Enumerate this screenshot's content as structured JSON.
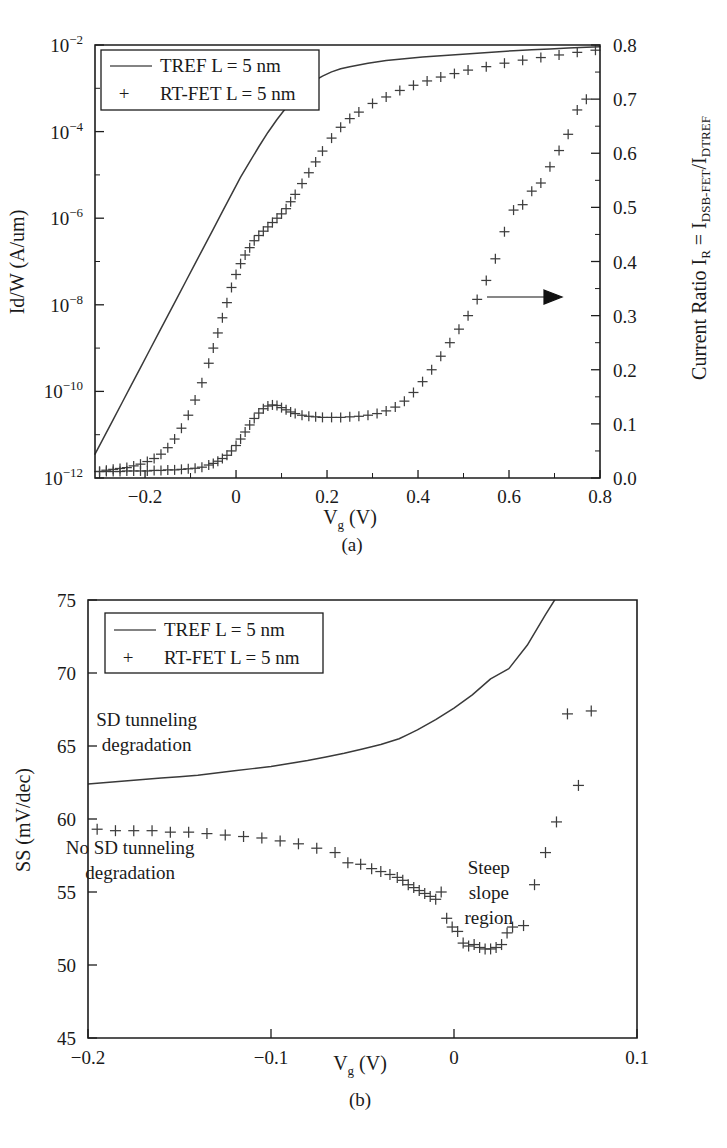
{
  "figure": {
    "panel_a_label": "(a)",
    "panel_b_label": "(b)"
  },
  "legend": {
    "series_line_label": "TREF L = 5 nm",
    "series_marker_label": "RT-FET L = 5 nm",
    "marker_glyph": "+"
  },
  "panel_a": {
    "xlabel_main": "V",
    "xlabel_sub": "g",
    "xlabel_unit": " (V)",
    "ylabel_left": "Id/W (A/um)",
    "ylabel_right_prefix": "Current Ratio I",
    "ylabel_right_sub1": "R",
    "ylabel_right_mid": " = I",
    "ylabel_right_sub2": "DSB-FET",
    "ylabel_right_slash": "/I",
    "ylabel_right_sub3": "DTREF",
    "xticks": [
      "-0.2",
      "0",
      "0.2",
      "0.4",
      "0.6",
      "0.8"
    ],
    "xtick_values": [
      -0.2,
      0,
      0.2,
      0.4,
      0.6,
      0.8
    ],
    "ytick_left_mantissa": "10",
    "ytick_left_exponents": [
      "-2",
      "-4",
      "-6",
      "-8",
      "-10",
      "-12"
    ],
    "ytick_right": [
      "0.0",
      "0.1",
      "0.2",
      "0.3",
      "0.4",
      "0.5",
      "0.6",
      "0.7",
      "0.8"
    ],
    "arrow_annotation": "arrow-pointing-right-to-right-axis"
  },
  "panel_b": {
    "xlabel_main": "V",
    "xlabel_sub": "g",
    "xlabel_unit": " (V)",
    "ylabel": "SS (mV/dec)",
    "xticks": [
      "-0.2",
      "-0.1",
      "0",
      "0.1"
    ],
    "xtick_values": [
      -0.2,
      -0.1,
      0,
      0.1
    ],
    "yticks": [
      "45",
      "50",
      "55",
      "60",
      "65",
      "70",
      "75"
    ],
    "ytick_values": [
      45,
      50,
      55,
      60,
      65,
      70,
      75
    ],
    "annotations": [
      {
        "line1": "SD tunneling",
        "line2": "degradation",
        "x": -0.168,
        "y": 66.4
      },
      {
        "line1": "No SD tunneling",
        "line2": "degradation",
        "x": -0.177,
        "y": 57.6
      },
      {
        "line1": "Steep",
        "line2": "slope",
        "line3": "region",
        "x": 0.019,
        "y": 56.2
      }
    ]
  },
  "chart_data": [
    {
      "type": "line",
      "id": "panel-a",
      "title": "",
      "xlabel": "Vg (V)",
      "ylabel": "Id/W (A/um)",
      "ylabel_right": "Current Ratio IR = IDSB-FET/IDTREF",
      "xlim": [
        -0.31,
        0.8
      ],
      "ylim_left_log10": [
        -12,
        -2
      ],
      "ylim_right": [
        0.0,
        0.8
      ],
      "grid": false,
      "legend_position": "top-left",
      "series": [
        {
          "name": "TREF L = 5 nm",
          "style": "line",
          "axis": "left",
          "x": [
            -0.31,
            -0.29,
            -0.27,
            -0.25,
            -0.23,
            -0.21,
            -0.19,
            -0.17,
            -0.15,
            -0.13,
            -0.11,
            -0.09,
            -0.07,
            -0.05,
            -0.03,
            -0.01,
            0.01,
            0.03,
            0.05,
            0.07,
            0.09,
            0.11,
            0.13,
            0.15,
            0.17,
            0.19,
            0.21,
            0.23,
            0.25,
            0.29,
            0.33,
            0.37,
            0.41,
            0.45,
            0.49,
            0.53,
            0.57,
            0.61,
            0.65,
            0.69,
            0.73,
            0.77,
            0.8
          ],
          "y_log10": [
            -11.45,
            -11.05,
            -10.65,
            -10.25,
            -9.85,
            -9.45,
            -9.05,
            -8.65,
            -8.25,
            -7.85,
            -7.45,
            -7.05,
            -6.65,
            -6.25,
            -5.85,
            -5.45,
            -5.05,
            -4.7,
            -4.35,
            -4.02,
            -3.72,
            -3.45,
            -3.2,
            -3.0,
            -2.84,
            -2.72,
            -2.62,
            -2.55,
            -2.5,
            -2.42,
            -2.36,
            -2.32,
            -2.28,
            -2.25,
            -2.22,
            -2.19,
            -2.16,
            -2.13,
            -2.11,
            -2.09,
            -2.07,
            -2.05,
            -2.04
          ]
        },
        {
          "name": "RT-FET L = 5 nm",
          "style": "markers",
          "axis": "left",
          "x": [
            -0.3,
            -0.285,
            -0.27,
            -0.255,
            -0.24,
            -0.225,
            -0.21,
            -0.195,
            -0.18,
            -0.165,
            -0.15,
            -0.135,
            -0.12,
            -0.105,
            -0.09,
            -0.075,
            -0.06,
            -0.05,
            -0.04,
            -0.03,
            -0.02,
            -0.01,
            0.0,
            0.01,
            0.02,
            0.03,
            0.04,
            0.05,
            0.06,
            0.07,
            0.08,
            0.09,
            0.1,
            0.11,
            0.12,
            0.13,
            0.145,
            0.16,
            0.175,
            0.19,
            0.21,
            0.23,
            0.25,
            0.27,
            0.3,
            0.33,
            0.36,
            0.39,
            0.42,
            0.45,
            0.48,
            0.51,
            0.55,
            0.59,
            0.63,
            0.67,
            0.71,
            0.75,
            0.79
          ],
          "y_log10": [
            -11.85,
            -11.82,
            -11.8,
            -11.78,
            -11.76,
            -11.72,
            -11.68,
            -11.62,
            -11.55,
            -11.45,
            -11.3,
            -11.1,
            -10.85,
            -10.55,
            -10.2,
            -9.8,
            -9.35,
            -9.0,
            -8.65,
            -8.3,
            -7.95,
            -7.6,
            -7.3,
            -7.05,
            -6.85,
            -6.68,
            -6.52,
            -6.4,
            -6.3,
            -6.2,
            -6.1,
            -6.0,
            -5.9,
            -5.78,
            -5.62,
            -5.45,
            -5.2,
            -4.95,
            -4.7,
            -4.45,
            -4.15,
            -3.9,
            -3.7,
            -3.55,
            -3.35,
            -3.2,
            -3.05,
            -2.93,
            -2.83,
            -2.74,
            -2.66,
            -2.58,
            -2.5,
            -2.42,
            -2.35,
            -2.29,
            -2.23,
            -2.17,
            -2.12
          ]
        },
        {
          "name": "Current Ratio",
          "style": "markers",
          "axis": "right",
          "x": [
            -0.3,
            -0.285,
            -0.27,
            -0.255,
            -0.24,
            -0.225,
            -0.21,
            -0.195,
            -0.18,
            -0.165,
            -0.15,
            -0.135,
            -0.12,
            -0.105,
            -0.09,
            -0.075,
            -0.06,
            -0.05,
            -0.04,
            -0.03,
            -0.02,
            -0.01,
            0.0,
            0.01,
            0.02,
            0.03,
            0.04,
            0.05,
            0.06,
            0.07,
            0.08,
            0.09,
            0.1,
            0.11,
            0.12,
            0.13,
            0.145,
            0.16,
            0.175,
            0.19,
            0.21,
            0.23,
            0.25,
            0.27,
            0.29,
            0.31,
            0.33,
            0.35,
            0.37,
            0.39,
            0.41,
            0.43,
            0.45,
            0.47,
            0.49,
            0.51,
            0.53,
            0.55,
            0.57,
            0.59,
            0.61,
            0.63,
            0.65,
            0.67,
            0.69,
            0.71,
            0.73,
            0.75,
            0.77
          ],
          "y": [
            0.012,
            0.012,
            0.012,
            0.012,
            0.013,
            0.013,
            0.013,
            0.013,
            0.014,
            0.014,
            0.015,
            0.015,
            0.016,
            0.017,
            0.018,
            0.02,
            0.024,
            0.027,
            0.031,
            0.036,
            0.042,
            0.05,
            0.06,
            0.072,
            0.085,
            0.098,
            0.11,
            0.12,
            0.128,
            0.133,
            0.135,
            0.134,
            0.13,
            0.126,
            0.122,
            0.119,
            0.116,
            0.114,
            0.113,
            0.112,
            0.112,
            0.112,
            0.113,
            0.114,
            0.116,
            0.119,
            0.124,
            0.131,
            0.142,
            0.158,
            0.178,
            0.2,
            0.225,
            0.25,
            0.275,
            0.3,
            0.33,
            0.365,
            0.405,
            0.455,
            0.495,
            0.505,
            0.53,
            0.545,
            0.575,
            0.605,
            0.635,
            0.68,
            0.7
          ]
        }
      ]
    },
    {
      "type": "scatter",
      "id": "panel-b",
      "title": "",
      "xlabel": "Vg (V)",
      "ylabel": "SS (mV/dec)",
      "xlim": [
        -0.2,
        0.1
      ],
      "ylim": [
        45,
        75
      ],
      "grid": false,
      "legend_position": "top-left",
      "series": [
        {
          "name": "TREF L = 5 nm",
          "style": "line",
          "x": [
            -0.2,
            -0.19,
            -0.18,
            -0.17,
            -0.16,
            -0.15,
            -0.14,
            -0.13,
            -0.12,
            -0.11,
            -0.1,
            -0.09,
            -0.08,
            -0.07,
            -0.06,
            -0.05,
            -0.04,
            -0.03,
            -0.025,
            -0.02,
            -0.01,
            0.0,
            0.01,
            0.02,
            0.03,
            0.04,
            0.05,
            0.055
          ],
          "y": [
            62.4,
            62.5,
            62.6,
            62.7,
            62.8,
            62.9,
            63.0,
            63.15,
            63.3,
            63.45,
            63.6,
            63.8,
            64.0,
            64.25,
            64.5,
            64.8,
            65.1,
            65.5,
            65.8,
            66.1,
            66.8,
            67.6,
            68.5,
            69.6,
            70.3,
            71.9,
            74.0,
            75.0
          ]
        },
        {
          "name": "RT-FET L = 5 nm",
          "style": "markers",
          "x": [
            -0.195,
            -0.185,
            -0.175,
            -0.165,
            -0.155,
            -0.145,
            -0.135,
            -0.125,
            -0.115,
            -0.105,
            -0.095,
            -0.085,
            -0.075,
            -0.065,
            -0.058,
            -0.051,
            -0.045,
            -0.04,
            -0.035,
            -0.031,
            -0.028,
            -0.025,
            -0.022,
            -0.019,
            -0.016,
            -0.013,
            -0.01,
            -0.007,
            -0.004,
            -0.001,
            0.002,
            0.005,
            0.008,
            0.011,
            0.014,
            0.017,
            0.02,
            0.023,
            0.026,
            0.029,
            0.032,
            0.038,
            0.044,
            0.05,
            0.056,
            0.062,
            0.068,
            0.075
          ],
          "y": [
            59.3,
            59.2,
            59.2,
            59.2,
            59.1,
            59.1,
            59.0,
            58.9,
            58.8,
            58.7,
            58.5,
            58.3,
            58.0,
            57.7,
            57.0,
            56.9,
            56.6,
            56.4,
            56.2,
            56.0,
            55.8,
            55.5,
            55.3,
            55.1,
            54.9,
            54.7,
            54.5,
            55.0,
            53.2,
            52.6,
            52.3,
            51.5,
            51.3,
            51.4,
            51.2,
            51.1,
            51.1,
            51.2,
            51.4,
            52.2,
            52.6,
            52.7,
            55.5,
            57.7,
            59.8,
            67.2,
            62.3,
            67.4
          ]
        }
      ]
    }
  ]
}
